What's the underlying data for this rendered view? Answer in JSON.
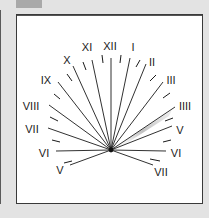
{
  "figure": {
    "tab_color": "#a9a9a9",
    "background": "#e3e3e3",
    "dial_background": "#ffffff",
    "line_color": "#1a1a1a",
    "shadow_color": "#bdbdbd"
  },
  "dial": {
    "center": [
      111,
      150
    ],
    "hours": [
      {
        "label": "V",
        "end": [
          70,
          165
        ],
        "label_pos": [
          60,
          174
        ]
      },
      {
        "label": "VI",
        "end": [
          56,
          151
        ],
        "label_pos": [
          44,
          157
        ]
      },
      {
        "label": "VII",
        "end": [
          48,
          128
        ],
        "label_pos": [
          32,
          133
        ]
      },
      {
        "label": "VIII",
        "end": [
          49,
          105
        ],
        "label_pos": [
          31,
          110
        ]
      },
      {
        "label": "IX",
        "end": [
          58,
          82
        ],
        "label_pos": [
          46,
          84
        ]
      },
      {
        "label": "X",
        "end": [
          73,
          66
        ],
        "label_pos": [
          67,
          64
        ]
      },
      {
        "label": "XI",
        "end": [
          92,
          60
        ],
        "label_pos": [
          87,
          51
        ]
      },
      {
        "label": "XII",
        "end": [
          111,
          58
        ],
        "label_pos": [
          110,
          50
        ]
      },
      {
        "label": "I",
        "end": [
          130,
          58
        ],
        "label_pos": [
          133,
          51
        ]
      },
      {
        "label": "II",
        "end": [
          146,
          64
        ],
        "label_pos": [
          152,
          66
        ]
      },
      {
        "label": "III",
        "end": [
          163,
          82
        ],
        "label_pos": [
          171,
          84
        ]
      },
      {
        "label": "IIII",
        "end": [
          175,
          107
        ],
        "label_pos": [
          185,
          110
        ]
      },
      {
        "label": "V",
        "end": [
          172,
          126
        ],
        "label_pos": [
          180,
          134
        ]
      },
      {
        "label": "VI",
        "end": [
          166,
          151
        ],
        "label_pos": [
          176,
          157
        ]
      },
      {
        "label": "VII",
        "end": [
          153,
          165
        ],
        "label_pos": [
          161,
          176
        ]
      }
    ],
    "ticks": [
      [
        [
          64,
          163
        ],
        [
          72,
          161
        ]
      ],
      [
        [
          52,
          140
        ],
        [
          60,
          142
        ]
      ],
      [
        [
          50,
          117
        ],
        [
          58,
          121
        ]
      ],
      [
        [
          54,
          94
        ],
        [
          60,
          99
        ]
      ],
      [
        [
          67,
          74
        ],
        [
          72,
          81
        ]
      ],
      [
        [
          83,
          62
        ],
        [
          86,
          70
        ]
      ],
      [
        [
          102,
          55
        ],
        [
          103,
          63
        ]
      ],
      [
        [
          121,
          55
        ],
        [
          120,
          63
        ]
      ],
      [
        [
          140,
          60
        ],
        [
          136,
          67
        ]
      ],
      [
        [
          156,
          75
        ],
        [
          150,
          81
        ]
      ],
      [
        [
          170,
          93
        ],
        [
          163,
          98
        ]
      ],
      [
        [
          173,
          118
        ],
        [
          165,
          121
        ]
      ],
      [
        [
          171,
          140
        ],
        [
          163,
          142
        ]
      ],
      [
        [
          160,
          161
        ],
        [
          150,
          159
        ]
      ]
    ],
    "shadow": {
      "from": [
        111,
        150
      ],
      "to": [
        172,
        110
      ],
      "hour": "IIII"
    }
  }
}
